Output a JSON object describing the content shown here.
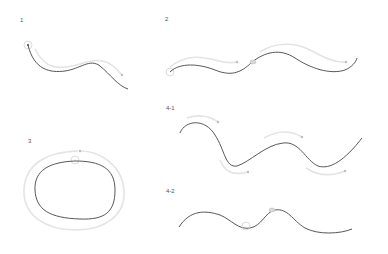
{
  "figure": {
    "panels": [
      {
        "id": "panel-1",
        "label": "1",
        "description": "single wavy stroke with circular start marker and light guide arrow"
      },
      {
        "id": "panel-2",
        "label": "2",
        "description": "long wave stroke with start marker, midpoint handle, and two light guide arrows"
      },
      {
        "id": "panel-3",
        "label": "3",
        "description": "closed oval stroke with outer light guide loop and top marker"
      },
      {
        "id": "panel-4-1",
        "label": "4-1",
        "description": "deep wave stroke with four light guide arrows"
      },
      {
        "id": "panel-4-2",
        "label": "4-2",
        "description": "wave stroke with two circle markers"
      }
    ],
    "colors": {
      "stroke": "#444444",
      "guide": "#e4e4e4",
      "marker": "#bdbdbd"
    }
  }
}
